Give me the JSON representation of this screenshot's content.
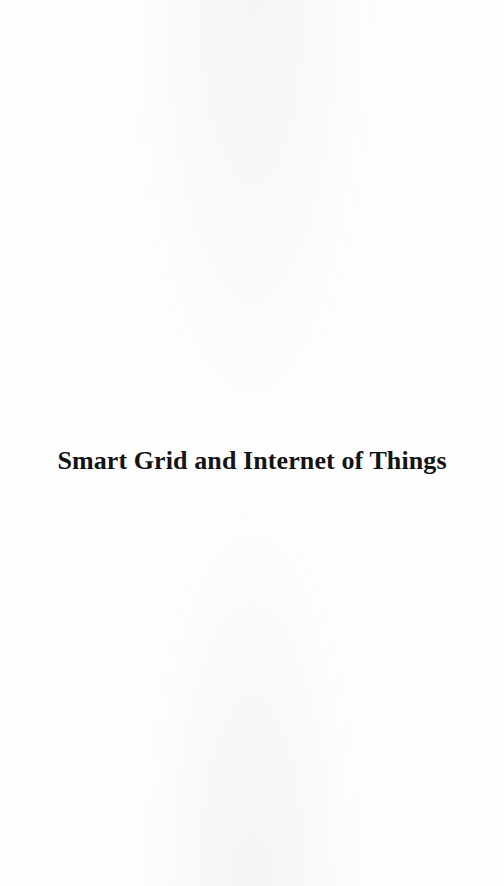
{
  "page": {
    "type": "half-title page",
    "background_color": "#fefefe",
    "text_color": "#141414"
  },
  "title": "Smart Grid and Internet of Things"
}
